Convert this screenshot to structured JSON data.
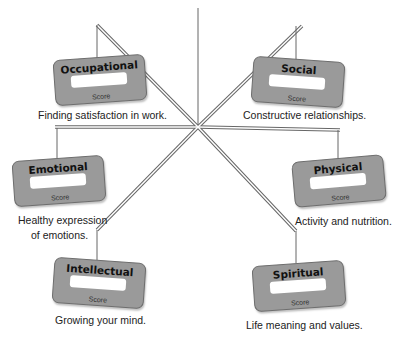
{
  "diagram": {
    "type": "wellness-wheel",
    "colors": {
      "card": "#9a9a9a",
      "card_border": "#6e6e6e",
      "line": "#555555",
      "score_box": "#ffffff"
    },
    "dimensions": [
      {
        "id": "occupational",
        "title": "Occupational",
        "score_label": "Score",
        "description": "Finding satisfaction in work."
      },
      {
        "id": "social",
        "title": "Social",
        "score_label": "Score",
        "description": "Constructive relationships."
      },
      {
        "id": "emotional",
        "title": "Emotional",
        "score_label": "Score",
        "description_line1": "Healthy expression",
        "description_line2": "of emotions."
      },
      {
        "id": "physical",
        "title": "Physical",
        "score_label": "Score",
        "description": "Activity and nutrition."
      },
      {
        "id": "intellectual",
        "title": "Intellectual",
        "score_label": "Score",
        "description": "Growing your mind."
      },
      {
        "id": "spiritual",
        "title": "Spiritual",
        "score_label": "Score",
        "description": "Life meaning and values."
      }
    ]
  }
}
